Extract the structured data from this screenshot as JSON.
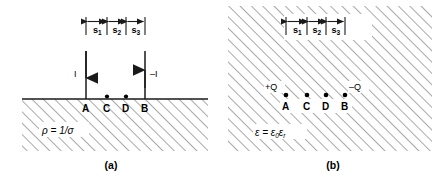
{
  "figure": {
    "title_caption_a": "(a)",
    "title_caption_b": "(b)",
    "panel_a": {
      "name": "conducting-half-space-four-electrode-array",
      "material_label": {
        "symbol": "ρ",
        "equals": " = 1/",
        "value": "σ",
        "full": "ρ = 1/σ"
      },
      "source_left": {
        "label": "I",
        "direction": "down",
        "at_point": "A"
      },
      "source_right": {
        "label": "–I",
        "direction": "up",
        "at_point": "B"
      },
      "points": [
        {
          "label": "A",
          "x": 86,
          "type": "electrode"
        },
        {
          "label": "C",
          "x": 107,
          "type": "probe"
        },
        {
          "label": "D",
          "x": 126,
          "type": "probe"
        },
        {
          "label": "B",
          "x": 145,
          "type": "electrode"
        }
      ],
      "segments": [
        {
          "label": "s",
          "sub": "1"
        },
        {
          "label": "s",
          "sub": "2"
        },
        {
          "label": "s",
          "sub": "3"
        }
      ]
    },
    "panel_b": {
      "name": "dielectric-medium-four-charge-array",
      "material_label": {
        "symbol": "ε",
        "equals": " = ",
        "eps0": "ε",
        "eps0_sub": "0",
        "epsr": "ε",
        "epsr_sub": "r",
        "full": "ε = ε₀εᵣ"
      },
      "charge_left": {
        "label": "+Q",
        "at_point": "A"
      },
      "charge_right": {
        "label": "–Q",
        "at_point": "B"
      },
      "points": [
        {
          "label": "A",
          "x": 64,
          "type": "charge"
        },
        {
          "label": "C",
          "x": 85,
          "type": "probe"
        },
        {
          "label": "D",
          "x": 104,
          "type": "probe"
        },
        {
          "label": "B",
          "x": 123,
          "type": "charge"
        }
      ],
      "segments": [
        {
          "label": "s",
          "sub": "1"
        },
        {
          "label": "s",
          "sub": "2"
        },
        {
          "label": "s",
          "sub": "3"
        }
      ]
    },
    "colors": {
      "ink": "#1a1a1a",
      "hatch": "#5a5a5a",
      "background": "#ffffff"
    }
  }
}
